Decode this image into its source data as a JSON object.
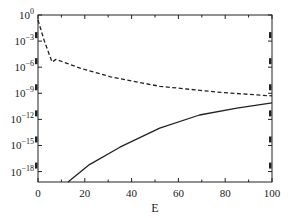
{
  "chart_data": {
    "type": "line",
    "title": "",
    "xlabel": "E",
    "ylabel": "",
    "xscale": "linear",
    "yscale": "log",
    "xlim": [
      0,
      100
    ],
    "ylim_log10": [
      -19.2,
      0
    ],
    "grid": false,
    "legend": null,
    "x_ticks": [
      0,
      20,
      40,
      60,
      80,
      100
    ],
    "x_tick_labels": [
      "0",
      "20",
      "40",
      "60",
      "80",
      "100"
    ],
    "x_minor_ticks": [
      10,
      30,
      50,
      70,
      90
    ],
    "y_ticks_log10": [
      0,
      -3,
      -6,
      -9,
      -12,
      -15,
      -18
    ],
    "y_tick_labels": [
      {
        "base": "10",
        "exp": "0"
      },
      {
        "base": "10",
        "exp": "-3"
      },
      {
        "base": "10",
        "exp": "-6"
      },
      {
        "base": "10",
        "exp": "-9"
      },
      {
        "base": "10",
        "exp": "-12"
      },
      {
        "base": "10",
        "exp": "-15"
      },
      {
        "base": "10",
        "exp": "-18"
      }
    ],
    "series": [
      {
        "name": "dashed",
        "style": "dashed",
        "color": "#222222",
        "x": [
          0,
          2.6,
          6,
          7.7,
          18,
          31,
          52,
          78,
          100
        ],
        "log10_y": [
          -0.57,
          -2.9,
          -5.4,
          -5.1,
          -6.1,
          -7.1,
          -8.2,
          -8.9,
          -9.3
        ]
      },
      {
        "name": "solid",
        "style": "solid",
        "color": "#222222",
        "x": [
          12.8,
          22,
          35,
          52,
          69,
          85,
          100
        ],
        "log10_y": [
          -19.2,
          -17.2,
          -15.2,
          -13.0,
          -11.5,
          -10.7,
          -10.1
        ]
      }
    ]
  }
}
